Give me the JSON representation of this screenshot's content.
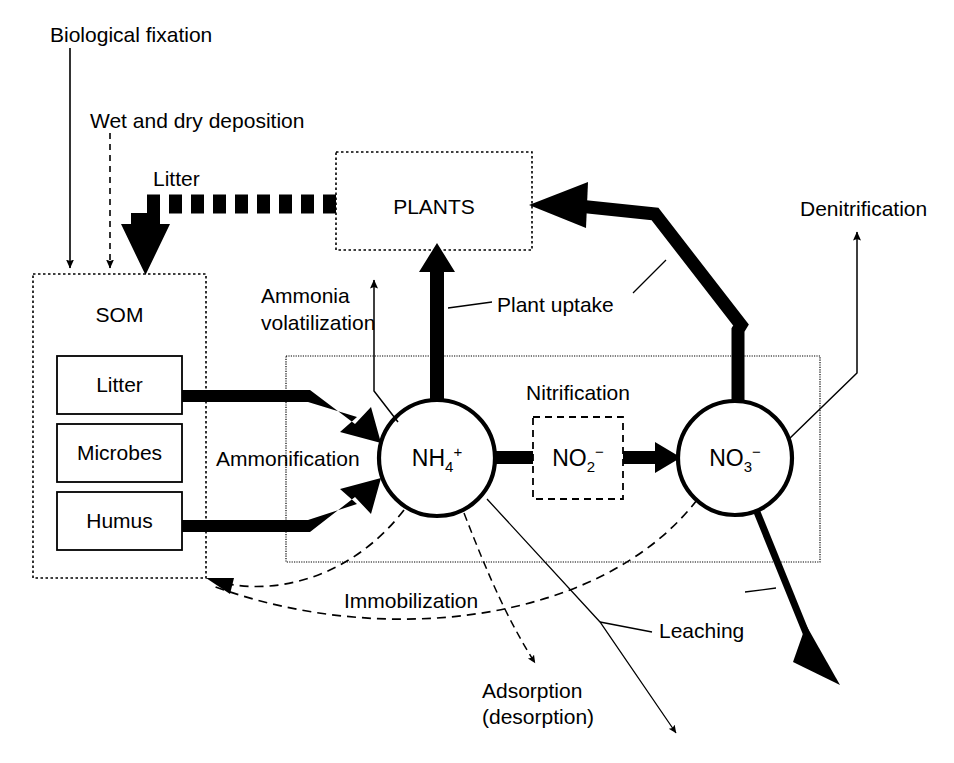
{
  "diagram": {
    "labels": {
      "biological_fixation": "Biological fixation",
      "wet_dry_deposition": "Wet and dry deposition",
      "litter_flux": "Litter",
      "plants": "PLANTS",
      "som": "SOM",
      "som_litter": "Litter",
      "som_microbes": "Microbes",
      "som_humus": "Humus",
      "ammonia_volatilization_line1": "Ammonia",
      "ammonia_volatilization_line2": "volatilization",
      "plant_uptake": "Plant uptake",
      "ammonification": "Ammonification",
      "nitrification": "Nitrification",
      "denitrification": "Denitrification",
      "immobilization": "Immobilization",
      "adsorption_line1": "Adsorption",
      "adsorption_line2": "(desorption)",
      "leaching": "Leaching"
    },
    "nodes": {
      "ammonium": {
        "base": "NH",
        "subscript": "4",
        "superscript": "+"
      },
      "nitrite": {
        "base": "NO",
        "subscript": "2",
        "superscript": "−"
      },
      "nitrate": {
        "base": "NO",
        "subscript": "3",
        "superscript": "−"
      }
    },
    "colors": {
      "stroke": "#000000",
      "fill": "#ffffff",
      "background": "#ffffff"
    }
  }
}
